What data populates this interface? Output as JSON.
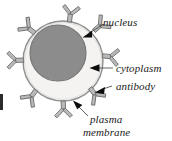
{
  "figure": {
    "kind": "biology-cell-diagram",
    "background_color": "#ffffff",
    "width": 172,
    "height": 141
  },
  "cell": {
    "plasma_membrane": {
      "label": "plasma membrane",
      "fill_color": "#f1f0ee",
      "stroke_color": "#8f8f8f",
      "center_x": 63,
      "center_y": 61,
      "radius": 40
    },
    "cytoplasm": {
      "label": "cytoplasm",
      "fill_color": "#f1f0ee"
    },
    "nucleus": {
      "label": "nucleus",
      "fill_color": "#8c8c8c",
      "stroke_color": "#6f6f6f",
      "center_x": 58,
      "center_y": 53,
      "radius": 28
    }
  },
  "antibody": {
    "label": "antibody",
    "fill_color": "#b8b8b8",
    "stroke_color": "#6e6e6e",
    "count": 8,
    "positions_deg": [
      255,
      295,
      330,
      8,
      45,
      86,
      120,
      160
    ]
  },
  "labels": {
    "nucleus": "nucleus",
    "cytoplasm": "cytoplasm",
    "antibody": "antibody",
    "plasma_membrane_line1": "plasma",
    "plasma_membrane_line2": "membrane"
  },
  "artifact": {
    "name": "page-edge-mark",
    "color": "#2b2b2b"
  }
}
